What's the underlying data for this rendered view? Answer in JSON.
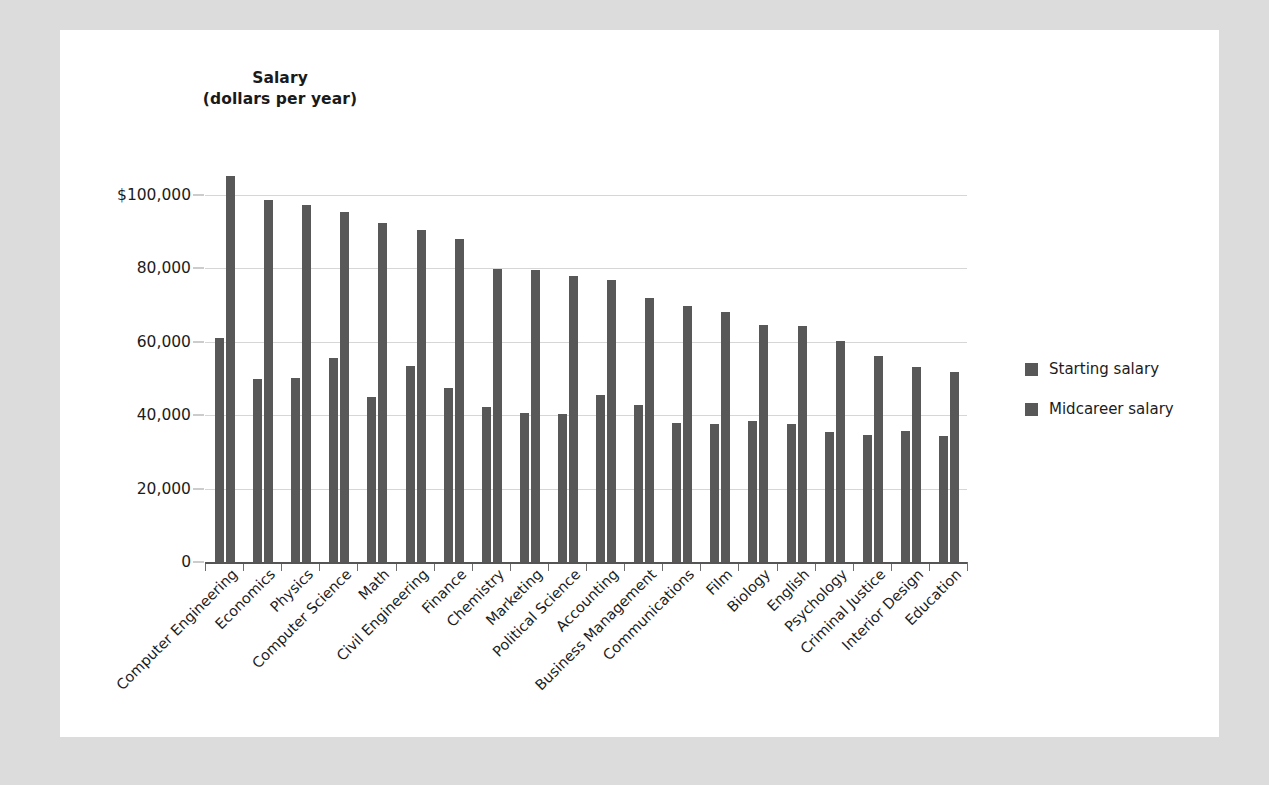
{
  "chart_data": {
    "type": "bar",
    "title": "Salary",
    "subtitle": "(dollars per year)",
    "xlabel": "",
    "ylabel": "Salary (dollars per year)",
    "ylim": [
      0,
      110000
    ],
    "grid": true,
    "legend_position": "right",
    "ytick_labels": [
      "$100,000",
      "80,000",
      "60,000",
      "40,000",
      "20,000",
      "0"
    ],
    "ytick_values": [
      100000,
      80000,
      60000,
      40000,
      20000,
      0
    ],
    "bar_color": "#585858",
    "categories": [
      "Computer Engineering",
      "Economics",
      "Physics",
      "Computer Science",
      "Math",
      "Civil Engineering",
      "Finance",
      "Chemistry",
      "Marketing",
      "Political Science",
      "Accounting",
      "Business Management",
      "Communications",
      "Film",
      "Biology",
      "English",
      "Psychology",
      "Criminal Justice",
      "Interior Design",
      "Education"
    ],
    "series": [
      {
        "name": "Starting salary",
        "color": "#585858",
        "values": [
          61000,
          49700,
          50000,
          55500,
          45000,
          53500,
          47500,
          42300,
          40500,
          40400,
          45600,
          42700,
          37800,
          37700,
          38300,
          37600,
          35400,
          34500,
          35600,
          34400
        ]
      },
      {
        "name": "Midcareer salary",
        "color": "#585858",
        "values": [
          105000,
          98500,
          97300,
          95400,
          92300,
          90400,
          88000,
          79800,
          79500,
          78000,
          76900,
          71800,
          69600,
          68000,
          64400,
          64200,
          60100,
          56000,
          53000,
          51700
        ]
      }
    ]
  },
  "legend": {
    "items": [
      {
        "label": "Starting salary",
        "color": "#585858"
      },
      {
        "label": "Midcareer salary",
        "color": "#585858"
      }
    ]
  }
}
